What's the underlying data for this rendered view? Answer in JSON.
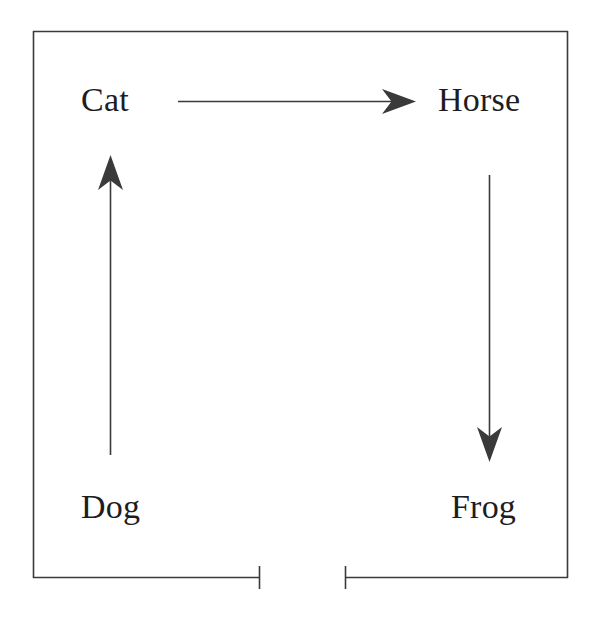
{
  "diagram": {
    "background_color": "#ffffff",
    "stroke_color": "#3a3a3a",
    "text_color": "#1d1d1f",
    "nodes": [
      {
        "id": "cat",
        "label": "Cat",
        "position": "top-left"
      },
      {
        "id": "horse",
        "label": "Horse",
        "position": "top-right"
      },
      {
        "id": "dog",
        "label": "Dog",
        "position": "bottom-left"
      },
      {
        "id": "frog",
        "label": "Frog",
        "position": "bottom-right"
      }
    ],
    "edges": [
      {
        "id": "cat-to-horse",
        "from": "Cat",
        "to": "Horse",
        "direction": "right",
        "arrowhead": true
      },
      {
        "id": "dog-to-cat",
        "from": "Dog",
        "to": "Cat",
        "direction": "up",
        "arrowhead": true
      },
      {
        "id": "horse-to-frog",
        "from": "Horse",
        "to": "Frog",
        "direction": "down",
        "arrowhead": true
      }
    ],
    "frame": {
      "id": "outer-frame",
      "left": 33,
      "top": 31,
      "right": 568,
      "bottom": 578,
      "bottom_gap_start": 259,
      "bottom_gap_end": 346,
      "bottom_gap_endcaps": true
    }
  }
}
